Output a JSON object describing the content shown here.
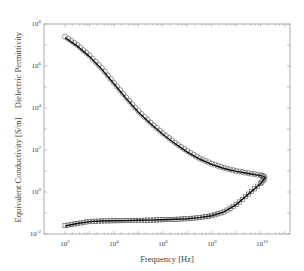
{
  "chart_data": {
    "type": "line",
    "title": "",
    "xlabel": "Frequency [Hz]",
    "ylabel_upper": "Dielectric Permittivity",
    "ylabel_lower": "Equivalent Conductivity [S/m]",
    "xscale": "log",
    "yscale": "log",
    "xlim_log10": [
      1.14,
      11.2
    ],
    "ylim_log10": [
      -2,
      8
    ],
    "x_ticks": [
      "10^2",
      "10^4",
      "10^6",
      "10^8",
      "10^10"
    ],
    "x_ticks_log10": [
      2,
      4,
      6,
      8,
      10
    ],
    "y_ticks": [
      "10^-2",
      "10^0",
      "10^2",
      "10^4",
      "10^6",
      "10^8"
    ],
    "y_ticks_log10": [
      -2,
      0,
      2,
      4,
      6,
      8
    ],
    "grid": false,
    "legend": "none",
    "series": [
      {
        "name": "Dielectric Permittivity (measured)",
        "marker": "circle",
        "style": "markers",
        "x_log10": [
          2.0,
          2.5,
          3.0,
          3.5,
          4.0,
          4.5,
          5.0,
          5.5,
          6.0,
          6.5,
          7.0,
          7.5,
          8.0,
          8.5,
          9.0,
          9.5,
          10.0,
          10.2
        ],
        "y_log10": [
          7.4,
          7.0,
          6.5,
          5.9,
          5.2,
          4.5,
          3.85,
          3.3,
          2.8,
          2.35,
          1.95,
          1.6,
          1.35,
          1.15,
          1.0,
          0.9,
          0.8,
          0.7
        ]
      },
      {
        "name": "Dielectric Permittivity (fit)",
        "marker": "none",
        "style": "solid",
        "x_log10": [
          2.0,
          2.5,
          3.0,
          3.5,
          4.0,
          4.5,
          5.0,
          5.5,
          6.0,
          6.5,
          7.0,
          7.5,
          8.0,
          8.5,
          9.0,
          9.5,
          10.0,
          10.2
        ],
        "y_log10": [
          7.35,
          6.95,
          6.45,
          5.85,
          5.15,
          4.45,
          3.8,
          3.25,
          2.75,
          2.3,
          1.9,
          1.57,
          1.32,
          1.12,
          0.98,
          0.88,
          0.78,
          0.7
        ]
      },
      {
        "name": "Equivalent Conductivity (measured)",
        "marker": "square",
        "style": "markers",
        "x_log10": [
          2.0,
          2.5,
          3.0,
          3.5,
          4.0,
          4.5,
          5.0,
          5.5,
          6.0,
          6.5,
          7.0,
          7.5,
          8.0,
          8.5,
          9.0,
          9.5,
          10.0,
          10.2
        ],
        "y_log10": [
          -1.6,
          -1.5,
          -1.4,
          -1.38,
          -1.37,
          -1.36,
          -1.35,
          -1.34,
          -1.32,
          -1.3,
          -1.27,
          -1.22,
          -1.13,
          -0.95,
          -0.6,
          -0.1,
          0.4,
          0.7
        ]
      },
      {
        "name": "Equivalent Conductivity (fit)",
        "marker": "none",
        "style": "solid",
        "x_log10": [
          2.0,
          2.5,
          3.0,
          3.5,
          4.0,
          4.5,
          5.0,
          5.5,
          6.0,
          6.5,
          7.0,
          7.5,
          8.0,
          8.5,
          9.0,
          9.5,
          10.0,
          10.2
        ],
        "y_log10": [
          -1.62,
          -1.5,
          -1.41,
          -1.38,
          -1.37,
          -1.36,
          -1.35,
          -1.34,
          -1.32,
          -1.3,
          -1.27,
          -1.22,
          -1.13,
          -0.95,
          -0.6,
          -0.1,
          0.4,
          0.7
        ]
      }
    ]
  },
  "axes": {
    "xlabel": "Frequency [Hz]",
    "ylabel_upper": "Dielectric Permittivity",
    "ylabel_lower": "Equivalent Conductivity [S/m]",
    "x_tick_labels": [
      {
        "base": "10",
        "exp": "2"
      },
      {
        "base": "10",
        "exp": "4"
      },
      {
        "base": "10",
        "exp": "6"
      },
      {
        "base": "10",
        "exp": "8"
      },
      {
        "base": "10",
        "exp": "10"
      }
    ],
    "y_tick_labels": [
      {
        "base": "10",
        "exp": "8"
      },
      {
        "base": "10",
        "exp": "6"
      },
      {
        "base": "10",
        "exp": "4"
      },
      {
        "base": "10",
        "exp": "2"
      },
      {
        "base": "10",
        "exp": "0"
      },
      {
        "base": "10",
        "exp": "-2"
      }
    ]
  }
}
